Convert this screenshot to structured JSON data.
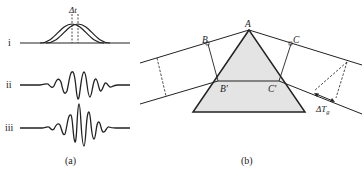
{
  "panel_a": {
    "caption": "(a)",
    "delay_label": "Δt",
    "rows": [
      {
        "label": "i",
        "kind": "two gaussian envelopes shifted by Δt"
      },
      {
        "label": "ii",
        "kind": "chirped oscillating pulse"
      },
      {
        "label": "iii",
        "kind": "oscillating pulse"
      }
    ]
  },
  "panel_b": {
    "caption": "(b)",
    "points": {
      "A": "A",
      "B": "B",
      "C": "C",
      "B_prime": "B′",
      "C_prime": "C′"
    },
    "group_delay_label": "ΔT",
    "group_delay_sub": "g",
    "prism_fill": "#e4e4e4",
    "line_color": "#222222"
  }
}
